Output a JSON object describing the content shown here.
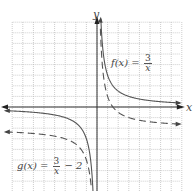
{
  "chart_data": {
    "type": "line",
    "title": "",
    "xlabel": "x",
    "ylabel": "y",
    "xlim": [
      -8,
      8
    ],
    "ylim": [
      -8,
      8
    ],
    "grid": true,
    "grid_step": 1,
    "tick_labels": false,
    "series": [
      {
        "name": "f(x) = 3/x",
        "style": "solid",
        "expression": "3/x",
        "vertical_asymptote": 0,
        "horizontal_asymptote": 0,
        "points": [
          [
            -8,
            -0.375
          ],
          [
            -6,
            -0.5
          ],
          [
            -4,
            -0.75
          ],
          [
            -3,
            -1
          ],
          [
            -2,
            -1.5
          ],
          [
            -1,
            -3
          ],
          [
            -0.5,
            -6
          ],
          [
            -0.375,
            -8
          ],
          [
            0.375,
            8
          ],
          [
            0.5,
            6
          ],
          [
            1,
            3
          ],
          [
            2,
            1.5
          ],
          [
            3,
            1
          ],
          [
            4,
            0.75
          ],
          [
            6,
            0.5
          ],
          [
            8,
            0.375
          ]
        ]
      },
      {
        "name": "g(x) = 3/x − 2",
        "style": "dashed",
        "expression": "3/x - 2",
        "vertical_asymptote": 0,
        "horizontal_asymptote": -2,
        "points": [
          [
            -8,
            -2.375
          ],
          [
            -6,
            -2.5
          ],
          [
            -4,
            -2.75
          ],
          [
            -3,
            -3
          ],
          [
            -2,
            -3.5
          ],
          [
            -1,
            -5
          ],
          [
            -0.5,
            -8
          ],
          [
            0.3,
            8
          ],
          [
            0.5,
            4
          ],
          [
            1,
            1
          ],
          [
            1.5,
            0
          ],
          [
            2,
            -0.5
          ],
          [
            3,
            -1
          ],
          [
            4,
            -1.25
          ],
          [
            6,
            -1.5
          ],
          [
            8,
            -1.625
          ]
        ]
      }
    ],
    "annotations": [
      {
        "text": "f(x) = 3/x",
        "near": [
          1.5,
          5
        ]
      },
      {
        "text": "g(x) = 3/x − 2",
        "near": [
          -7,
          -5.5
        ]
      }
    ]
  },
  "labels": {
    "y_axis": "y",
    "x_axis": "x",
    "f_prefix": "f(x) =",
    "f_num": "3",
    "f_den": "x",
    "g_prefix": "g(x) =",
    "g_num": "3",
    "g_den": "x",
    "g_suffix": "− 2"
  }
}
